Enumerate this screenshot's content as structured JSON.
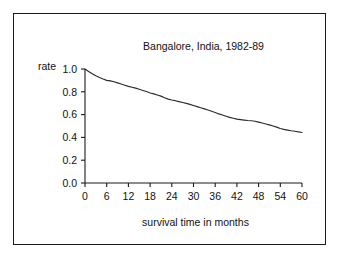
{
  "figure": {
    "border_color": "#1a1a1a",
    "background": "#ffffff"
  },
  "chart_data": {
    "type": "line",
    "title": "Bangalore, India, 1982-89",
    "xlabel": "survival time in months",
    "ylabel": "rate",
    "xlim": [
      0,
      60
    ],
    "ylim": [
      0.0,
      1.0
    ],
    "grid": false,
    "legend": null,
    "line_color": "#2b2b2b",
    "xticks": [
      0,
      6,
      12,
      18,
      24,
      30,
      36,
      42,
      48,
      54,
      60
    ],
    "xtick_labels": [
      "0",
      "6",
      "12",
      "18",
      "24",
      "30",
      "36",
      "42",
      "48",
      "54",
      "60"
    ],
    "yticks": [
      0.0,
      0.2,
      0.4,
      0.6,
      0.8,
      1.0
    ],
    "ytick_labels": [
      "0.0",
      "0.2",
      "0.4",
      "0.6",
      "0.8",
      "1.0"
    ],
    "series": [
      {
        "name": "survival rate",
        "x": [
          0,
          1,
          2,
          3,
          4,
          5,
          6,
          7,
          8,
          9,
          10,
          11,
          12,
          13,
          14,
          15,
          16,
          17,
          18,
          19,
          20,
          21,
          22,
          23,
          24,
          25,
          26,
          27,
          28,
          29,
          30,
          31,
          32,
          33,
          34,
          35,
          36,
          37,
          38,
          39,
          40,
          41,
          42,
          43,
          44,
          45,
          46,
          47,
          48,
          49,
          50,
          51,
          52,
          53,
          54,
          55,
          56,
          57,
          58,
          59,
          60
        ],
        "y": [
          1.0,
          0.978,
          0.958,
          0.94,
          0.925,
          0.912,
          0.9,
          0.896,
          0.888,
          0.878,
          0.868,
          0.858,
          0.848,
          0.84,
          0.832,
          0.822,
          0.812,
          0.802,
          0.79,
          0.782,
          0.772,
          0.762,
          0.748,
          0.736,
          0.728,
          0.722,
          0.714,
          0.706,
          0.698,
          0.69,
          0.68,
          0.67,
          0.66,
          0.65,
          0.64,
          0.63,
          0.618,
          0.606,
          0.596,
          0.586,
          0.576,
          0.568,
          0.56,
          0.556,
          0.552,
          0.548,
          0.546,
          0.542,
          0.534,
          0.526,
          0.518,
          0.51,
          0.5,
          0.49,
          0.478,
          0.47,
          0.464,
          0.458,
          0.454,
          0.448,
          0.443
        ]
      }
    ]
  }
}
